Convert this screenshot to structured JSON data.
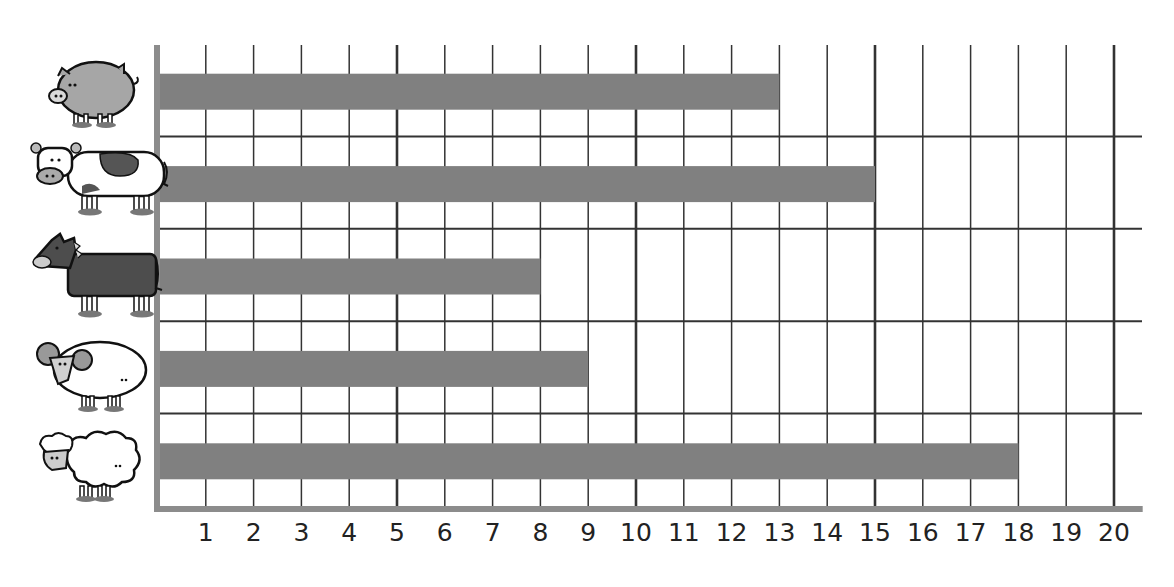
{
  "chart_data": {
    "type": "bar",
    "orientation": "horizontal",
    "title": "",
    "title_note": "title cropped at top edge, illegible",
    "xlabel": "",
    "ylabel": "",
    "categories": [
      "Pig",
      "Cow",
      "Horse",
      "Ram",
      "Sheep"
    ],
    "category_icons": [
      "pig-icon",
      "cow-icon",
      "horse-icon",
      "ram-icon",
      "sheep-icon"
    ],
    "values": [
      13,
      15,
      8,
      9,
      18
    ],
    "xlim": [
      0,
      20
    ],
    "xticks": [
      1,
      2,
      3,
      4,
      5,
      6,
      7,
      8,
      9,
      10,
      11,
      12,
      13,
      14,
      15,
      16,
      17,
      18,
      19,
      20
    ],
    "major_every": 5,
    "grid": true,
    "legend": "none",
    "colors": {
      "bar": "#808080",
      "axis": "#8c8c8c",
      "grid": "#333333",
      "text": "#222222"
    }
  }
}
